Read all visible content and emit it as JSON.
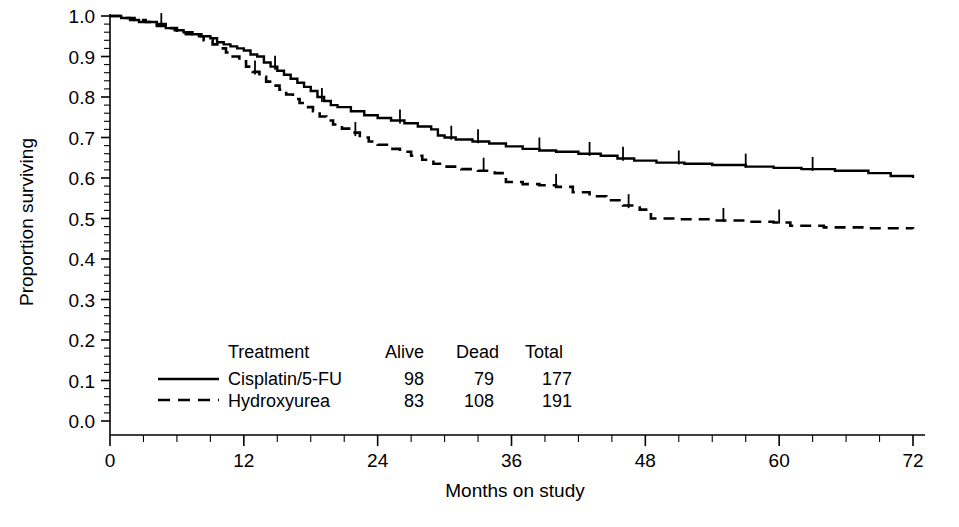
{
  "chart_data": {
    "type": "line",
    "title": "",
    "subtitle": "",
    "xlabel": "Months on study",
    "ylabel": "Proportion surviving",
    "xlim": [
      0,
      72
    ],
    "ylim": [
      0.0,
      1.0
    ],
    "grid": false,
    "legend_position": "inside-lower-left",
    "x_ticks": [
      0,
      12,
      24,
      36,
      48,
      60,
      72
    ],
    "x_tick_labels": [
      "0",
      "12",
      "24",
      "36",
      "48",
      "60",
      "72"
    ],
    "x_minor_tick_interval": 3,
    "y_ticks": [
      0.0,
      0.1,
      0.2,
      0.3,
      0.4,
      0.5,
      0.6,
      0.7,
      0.8,
      0.9,
      1.0
    ],
    "y_tick_labels": [
      "0.0",
      "0.1",
      "0.2",
      "0.3",
      "0.4",
      "0.5",
      "0.6",
      "0.7",
      "0.8",
      "0.9",
      "1.0"
    ],
    "y_minor_tick_interval": 0.02,
    "series": [
      {
        "name": "Cisplatin/5-FU",
        "style": "solid",
        "color": "#000000",
        "steps": [
          [
            0.0,
            1.0
          ],
          [
            1.0,
            0.995
          ],
          [
            1.8,
            0.99
          ],
          [
            2.6,
            0.985
          ],
          [
            3.4,
            0.985
          ],
          [
            4.2,
            0.975
          ],
          [
            5.0,
            0.97
          ],
          [
            5.8,
            0.965
          ],
          [
            6.6,
            0.96
          ],
          [
            7.4,
            0.955
          ],
          [
            8.2,
            0.95
          ],
          [
            9.0,
            0.945
          ],
          [
            9.6,
            0.935
          ],
          [
            10.2,
            0.93
          ],
          [
            10.8,
            0.925
          ],
          [
            11.4,
            0.92
          ],
          [
            12.0,
            0.915
          ],
          [
            12.6,
            0.905
          ],
          [
            13.2,
            0.9
          ],
          [
            13.8,
            0.885
          ],
          [
            14.4,
            0.875
          ],
          [
            15.0,
            0.865
          ],
          [
            15.6,
            0.855
          ],
          [
            16.2,
            0.845
          ],
          [
            16.8,
            0.835
          ],
          [
            17.4,
            0.825
          ],
          [
            18.0,
            0.815
          ],
          [
            18.6,
            0.8
          ],
          [
            19.2,
            0.79
          ],
          [
            19.8,
            0.78
          ],
          [
            20.4,
            0.775
          ],
          [
            21.6,
            0.765
          ],
          [
            22.8,
            0.755
          ],
          [
            24.0,
            0.748
          ],
          [
            25.2,
            0.742
          ],
          [
            26.4,
            0.735
          ],
          [
            27.6,
            0.727
          ],
          [
            28.8,
            0.72
          ],
          [
            29.4,
            0.705
          ],
          [
            30.0,
            0.7
          ],
          [
            31.0,
            0.695
          ],
          [
            32.5,
            0.69
          ],
          [
            34.0,
            0.685
          ],
          [
            35.5,
            0.678
          ],
          [
            37.0,
            0.672
          ],
          [
            38.5,
            0.668
          ],
          [
            40.0,
            0.665
          ],
          [
            42.0,
            0.66
          ],
          [
            44.0,
            0.655
          ],
          [
            45.5,
            0.648
          ],
          [
            47.0,
            0.643
          ],
          [
            49.0,
            0.638
          ],
          [
            51.5,
            0.635
          ],
          [
            54.0,
            0.632
          ],
          [
            57.0,
            0.628
          ],
          [
            59.5,
            0.625
          ],
          [
            62.0,
            0.622
          ],
          [
            65.0,
            0.618
          ],
          [
            68.0,
            0.612
          ],
          [
            70.0,
            0.605
          ],
          [
            72.0,
            0.6
          ]
        ],
        "censored": [
          [
            4.6,
            0.975
          ],
          [
            14.8,
            0.87
          ],
          [
            19.0,
            0.79
          ],
          [
            26.0,
            0.737
          ],
          [
            30.6,
            0.697
          ],
          [
            33.0,
            0.688
          ],
          [
            38.5,
            0.668
          ],
          [
            43.0,
            0.657
          ],
          [
            46.0,
            0.645
          ],
          [
            51.0,
            0.636
          ],
          [
            57.0,
            0.628
          ],
          [
            63.0,
            0.62
          ]
        ],
        "alive": 98,
        "dead": 79,
        "total": 177
      },
      {
        "name": "Hydroxyurea",
        "style": "dashed",
        "color": "#000000",
        "steps": [
          [
            0.0,
            1.0
          ],
          [
            1.2,
            0.995
          ],
          [
            2.2,
            0.99
          ],
          [
            3.2,
            0.985
          ],
          [
            4.2,
            0.98
          ],
          [
            5.2,
            0.97
          ],
          [
            6.0,
            0.96
          ],
          [
            6.8,
            0.955
          ],
          [
            7.6,
            0.95
          ],
          [
            8.4,
            0.94
          ],
          [
            9.2,
            0.93
          ],
          [
            9.8,
            0.92
          ],
          [
            10.4,
            0.91
          ],
          [
            11.0,
            0.9
          ],
          [
            11.6,
            0.888
          ],
          [
            12.2,
            0.875
          ],
          [
            12.8,
            0.862
          ],
          [
            13.4,
            0.85
          ],
          [
            14.0,
            0.838
          ],
          [
            14.6,
            0.828
          ],
          [
            15.2,
            0.818
          ],
          [
            15.8,
            0.806
          ],
          [
            16.4,
            0.795
          ],
          [
            17.0,
            0.785
          ],
          [
            17.6,
            0.775
          ],
          [
            18.2,
            0.765
          ],
          [
            18.8,
            0.752
          ],
          [
            19.4,
            0.742
          ],
          [
            20.0,
            0.732
          ],
          [
            20.8,
            0.722
          ],
          [
            21.6,
            0.712
          ],
          [
            22.4,
            0.7
          ],
          [
            23.2,
            0.69
          ],
          [
            24.0,
            0.682
          ],
          [
            25.0,
            0.672
          ],
          [
            26.0,
            0.665
          ],
          [
            27.0,
            0.655
          ],
          [
            28.0,
            0.645
          ],
          [
            29.0,
            0.635
          ],
          [
            30.0,
            0.628
          ],
          [
            31.5,
            0.622
          ],
          [
            33.0,
            0.618
          ],
          [
            34.5,
            0.612
          ],
          [
            35.5,
            0.59
          ],
          [
            37.0,
            0.585
          ],
          [
            38.5,
            0.582
          ],
          [
            40.0,
            0.578
          ],
          [
            41.5,
            0.565
          ],
          [
            43.0,
            0.555
          ],
          [
            44.5,
            0.545
          ],
          [
            46.0,
            0.532
          ],
          [
            47.5,
            0.522
          ],
          [
            48.5,
            0.5
          ],
          [
            51.0,
            0.498
          ],
          [
            54.0,
            0.495
          ],
          [
            57.0,
            0.492
          ],
          [
            59.5,
            0.49
          ],
          [
            61.0,
            0.482
          ],
          [
            64.0,
            0.478
          ],
          [
            68.0,
            0.476
          ],
          [
            72.0,
            0.475
          ]
        ],
        "censored": [
          [
            13.0,
            0.858
          ],
          [
            22.0,
            0.706
          ],
          [
            33.5,
            0.618
          ],
          [
            40.0,
            0.578
          ],
          [
            46.5,
            0.528
          ],
          [
            55.0,
            0.494
          ],
          [
            60.0,
            0.49
          ]
        ],
        "alive": 83,
        "dead": 108,
        "total": 191
      }
    ]
  },
  "legend": {
    "headers": {
      "treatment": "Treatment",
      "alive": "Alive",
      "dead": "Dead",
      "total": "Total"
    },
    "rows": [
      {
        "style": "solid",
        "treatment": "Cisplatin/5-FU",
        "alive": "98",
        "dead": "79",
        "total": "177"
      },
      {
        "style": "dashed",
        "treatment": "Hydroxyurea",
        "alive": "83",
        "dead": "108",
        "total": "191"
      }
    ]
  },
  "axes": {
    "x_title": "Months on study",
    "y_title": "Proportion surviving"
  },
  "colors": {
    "background": "#ffffff",
    "foreground": "#000000"
  }
}
